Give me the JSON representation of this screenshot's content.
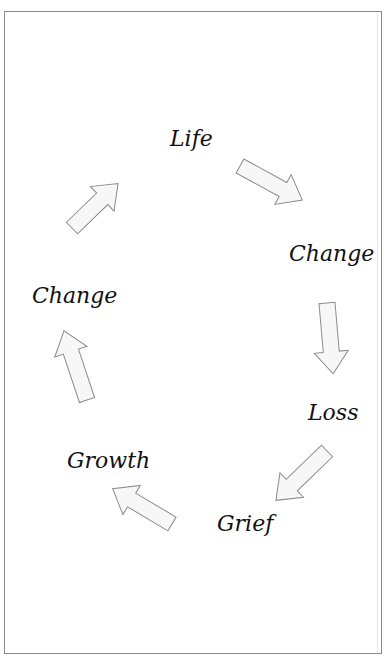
{
  "diagram": {
    "type": "cycle",
    "nodes": [
      {
        "id": "life",
        "label": "Life"
      },
      {
        "id": "change_1",
        "label": "Change"
      },
      {
        "id": "loss",
        "label": "Loss"
      },
      {
        "id": "grief",
        "label": "Grief"
      },
      {
        "id": "growth",
        "label": "Growth"
      },
      {
        "id": "change_2",
        "label": "Change"
      }
    ],
    "edges": [
      {
        "from": "life",
        "to": "change_1"
      },
      {
        "from": "change_1",
        "to": "loss"
      },
      {
        "from": "loss",
        "to": "grief"
      },
      {
        "from": "grief",
        "to": "growth"
      },
      {
        "from": "growth",
        "to": "change_2"
      },
      {
        "from": "change_2",
        "to": "life"
      }
    ]
  },
  "colors": {
    "border": "#8a8a8a",
    "arrow_fill": "#f7f7f7",
    "arrow_stroke": "#8c8c8c",
    "text": "#111111"
  }
}
